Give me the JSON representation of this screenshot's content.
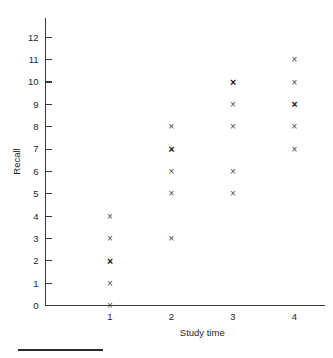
{
  "chart_data": {
    "type": "scatter",
    "title": "",
    "xlabel": "Study time",
    "ylabel": "Recall",
    "xlim": [
      0.4,
      4.6
    ],
    "ylim": [
      0,
      12.8
    ],
    "xticks": [
      1,
      2,
      3,
      4
    ],
    "xtick_labels": [
      "1",
      "2",
      "3",
      "4"
    ],
    "yticks": [
      0,
      1,
      2,
      3,
      4,
      5,
      6,
      7,
      8,
      9,
      10,
      11,
      12
    ],
    "ytick_labels": [
      "0",
      "1",
      "2",
      "3",
      "4",
      "5",
      "6",
      "7",
      "8",
      "9",
      "10",
      "11",
      "12"
    ],
    "grid": false,
    "legend": false,
    "marker_glyph": "×",
    "marker_color": "#4a4a4a",
    "marker_overlap_color": "#111111",
    "points": [
      {
        "x": 1,
        "y": 0,
        "count": 1
      },
      {
        "x": 1,
        "y": 1,
        "count": 1
      },
      {
        "x": 1,
        "y": 2,
        "count": 2
      },
      {
        "x": 1,
        "y": 3,
        "count": 1
      },
      {
        "x": 1,
        "y": 4,
        "count": 1
      },
      {
        "x": 2,
        "y": 3,
        "count": 1
      },
      {
        "x": 2,
        "y": 5,
        "count": 1
      },
      {
        "x": 2,
        "y": 6,
        "count": 1
      },
      {
        "x": 2,
        "y": 7,
        "count": 2
      },
      {
        "x": 2,
        "y": 8,
        "count": 1
      },
      {
        "x": 3,
        "y": 5,
        "count": 1
      },
      {
        "x": 3,
        "y": 6,
        "count": 1
      },
      {
        "x": 3,
        "y": 8,
        "count": 1
      },
      {
        "x": 3,
        "y": 9,
        "count": 1
      },
      {
        "x": 3,
        "y": 10,
        "count": 2
      },
      {
        "x": 4,
        "y": 7,
        "count": 1
      },
      {
        "x": 4,
        "y": 8,
        "count": 1
      },
      {
        "x": 4,
        "y": 9,
        "count": 2
      },
      {
        "x": 4,
        "y": 10,
        "count": 1
      },
      {
        "x": 4,
        "y": 11,
        "count": 1
      }
    ]
  },
  "footer": {
    "rule_visible": true
  }
}
